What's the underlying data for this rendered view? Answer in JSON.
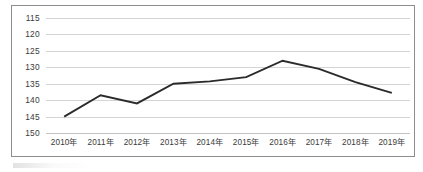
{
  "chart_data": {
    "type": "line",
    "title": "",
    "subtitle": "",
    "xlabel": "",
    "ylabel": "",
    "categories": [
      "2010年",
      "2011年",
      "2012年",
      "2013年",
      "2014年",
      "2015年",
      "2016年",
      "2017年",
      "2018年",
      "2019年"
    ],
    "series": [
      {
        "name": "series-1",
        "values": [
          145.0,
          138.5,
          141.0,
          135.0,
          134.3,
          133.0,
          128.0,
          130.5,
          134.5,
          137.8
        ],
        "color": "#2b2b2b"
      }
    ],
    "ylim": [
      115,
      150
    ],
    "y_axis_inverted": true,
    "y_ticks": [
      115,
      120,
      125,
      130,
      135,
      140,
      145,
      150
    ],
    "y_tick_labels": [
      "115",
      "120",
      "125",
      "130",
      "135",
      "140",
      "145",
      "150"
    ],
    "grid": true,
    "grid_color": "#c9c9c9",
    "legend": false,
    "legend_position": "none",
    "annotations": [],
    "border_color": "#8d8d8d",
    "background": "#ffffff"
  },
  "layout": {
    "plot_left": 46,
    "plot_right": 410,
    "plot_top": 18,
    "plot_bottom": 133,
    "x_label_y": 145
  }
}
